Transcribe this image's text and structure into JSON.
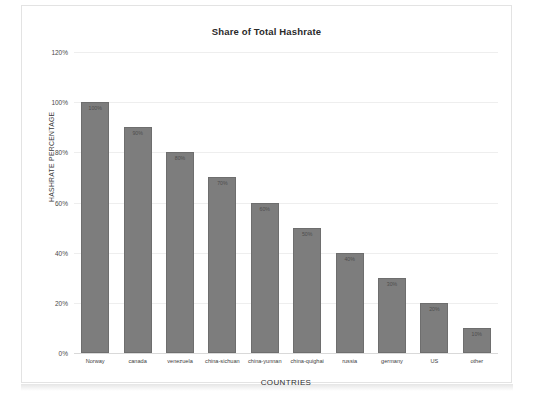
{
  "chart_data": {
    "type": "bar",
    "title": "Share of Total Hashrate",
    "xlabel": "COUNTRIES",
    "ylabel": "HASHRATE PERCENTAGE",
    "categories": [
      "Norway",
      "canada",
      "venezuela",
      "china-sichuan",
      "china-yunnan",
      "china-quighai",
      "russia",
      "germany",
      "US",
      "other"
    ],
    "values": [
      100,
      90,
      80,
      70,
      60,
      50,
      40,
      30,
      20,
      10
    ],
    "value_labels": [
      "100%",
      "90%",
      "80%",
      "70%",
      "60%",
      "50%",
      "40%",
      "30%",
      "20%",
      "10%"
    ],
    "ylim": [
      0,
      120
    ],
    "yticks": [
      0,
      20,
      40,
      60,
      80,
      100,
      120
    ],
    "ytick_labels": [
      "0%",
      "20%",
      "40%",
      "60%",
      "80%",
      "100%",
      "120%"
    ],
    "grid": true,
    "legend": false,
    "bar_color": "#7d7d7d",
    "plot_background": "#ffffff"
  }
}
